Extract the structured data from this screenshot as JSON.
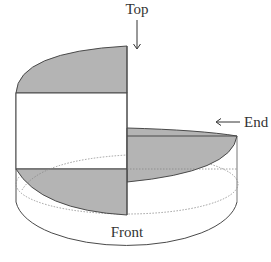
{
  "diagram": {
    "labels": {
      "top": "Top",
      "end": "End",
      "front": "Front"
    },
    "colors": {
      "fill_gray": "#b4b4b4",
      "stroke": "#4a4a4a",
      "hidden_line": "#777777",
      "background": "#ffffff"
    },
    "views": [
      {
        "name": "top-view",
        "pointer": "arrow-down"
      },
      {
        "name": "end-view",
        "pointer": "arrow-left"
      },
      {
        "name": "front-view",
        "pointer": "none"
      }
    ]
  }
}
